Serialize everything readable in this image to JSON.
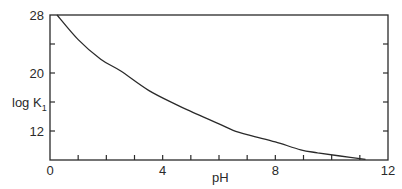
{
  "chart_data": {
    "type": "line",
    "title": "",
    "xlabel": "pH",
    "ylabel": "log K1",
    "ylabel_main": "log K",
    "ylabel_sub": "1",
    "xlim": [
      0,
      12
    ],
    "ylim": [
      8,
      28
    ],
    "x_ticks": [
      0,
      1,
      2,
      3,
      4,
      5,
      6,
      7,
      8,
      9,
      10,
      11,
      12
    ],
    "x_tick_labels": [
      "0",
      "4",
      "8",
      "12"
    ],
    "x_tick_label_values": [
      0,
      4,
      8,
      12
    ],
    "y_ticks": [
      28,
      24,
      20,
      16,
      12
    ],
    "y_tick_labels": [
      "28",
      "20",
      "12"
    ],
    "y_tick_label_values": [
      28,
      20,
      12
    ],
    "grid": false,
    "legend": null,
    "series": [
      {
        "name": "log K1",
        "x": [
          0.25,
          1.0,
          1.8,
          2.5,
          3.5,
          4.5,
          5.0,
          6.0,
          6.5,
          7.1,
          8.0,
          8.9,
          9.5,
          10.3,
          11.2
        ],
        "y": [
          28.0,
          24.6,
          21.9,
          20.3,
          17.6,
          15.6,
          14.7,
          13.0,
          12.1,
          11.4,
          10.5,
          9.4,
          9.0,
          8.55,
          8.1
        ]
      }
    ]
  }
}
